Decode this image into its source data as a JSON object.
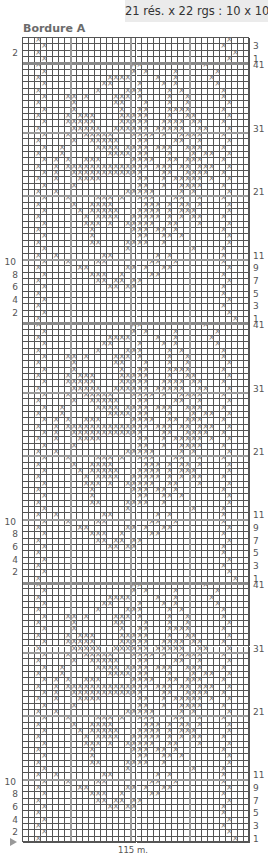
{
  "gauge": "21 rés. x 22 rgs : 10 x 10 cm",
  "title": "Bordure A",
  "footer": {
    "stitch_count": "115 m.",
    "start_marker": "arrow-right"
  },
  "chart_data": {
    "type": "knitting-chart",
    "columns": 38,
    "column_blocks": [
      8,
      10,
      10,
      10
    ],
    "symbol": "×",
    "top_fragment": {
      "row_count": 4,
      "labels_right": [
        {
          "row": 3,
          "text": "3"
        },
        {
          "row": 1,
          "text": "1"
        }
      ],
      "labels_left": [
        {
          "row": 2,
          "text": "2"
        }
      ],
      "rows_top_to_bottom": [
        "..x...............................x.",
        "...x.............................x..",
        "..x................................x",
        "...x..............................x."
      ]
    },
    "repeat": {
      "row_count": 41,
      "repeats": 3,
      "labels_right": [
        "41",
        "31",
        "21",
        "11",
        "9",
        "7",
        "5",
        "3",
        "1"
      ],
      "labels_left": [
        "10",
        "8",
        "6",
        "4",
        "2"
      ],
      "rows_top_to_bottom": [
        "..x...............xx..........x.....",
        "...x..............x.x....x......x...",
        "..x...........xxxx....x..x.....x....",
        "...x.........xx....x...x.x......x...",
        "..x.........x....xxx....x.x......x..",
        "...x...xx.x....xxx.x....x..x.....x..",
        "..x.....x......xx...x...x..x......x.",
        "...x....x.......x..xx...xxxx.....x..",
        "..x....x.xxx....xxxxx...x..xx.....x.",
        "...x...xxxxx....xxxxx..xxxx.xx...x..",
        "..x.....xxxxx..xxxxxx.xxxxx..xx...x.",
        "...x...x..xxxxx...xxxx.x..xxxx...x..",
        "..x.....x..xxxxx...xx....xx..x....x.",
        "...x..x.....xxxx.xxxx.xxx..xxx...x..",
        "..x...x.......xxxx.xx...x...x.xx..x.",
        "...x.x.x..xxx.....xxxx..xx.xxx...x..",
        "..x..x.xxxxxxxxxxxxxx.xxx.xx.xxx..x.",
        "...x.x..xxxxxxxxxxxx...xx..xxxx..x..",
        "..x..x...xxxx......xx..x.xxxxx.x..x.",
        "...x....x..........xx..x..xxxx...x..",
        "..x..x...........xxxxx....x.x.....x.",
        "...x...x....xxx.x..xxx...xx..x...x..",
        "..x.....x..xxxx.....xxx.x.xx.x....x.",
        "...x.....x.xxxxx...xxxx.x.xxx.....x.",
        "..x.......x.xxxx..xxxxx.x.x.xx...x..",
        "...x......xxx.x..xxxxx..xx...x....x.",
        "..x........x......xxx.xx.x.......x..",
        "...x.......x.......xx..xx.x.......x.",
        "..x........xx....xxxx..x..........x.",
        "...x.............x..........x....x..",
        "..x..x.......xx.......x.x........x..",
        "...x...x....xx.......xx..x.......x..",
        "..x......xx......xx.x..xx.........x.",
        "...x.......xxx..x....xx..........x..",
        "..x.........xx.xx.xx..............x.",
        "...x..........xx.xx..............x..",
        "..x..............................x..",
        "...x..............................x.",
        "..x..............................x..",
        "...x..............................x.",
        "..x................................x"
      ]
    }
  }
}
